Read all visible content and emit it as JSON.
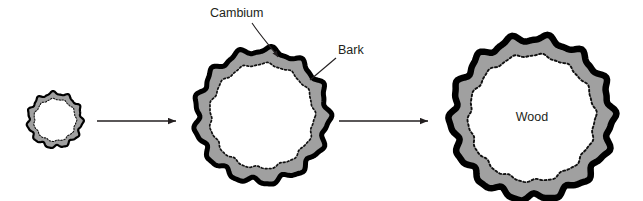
{
  "figure": {
    "background_color": "#ffffff",
    "width": 643,
    "height": 201
  },
  "labels": {
    "cambium": "Cambium",
    "bark": "Bark",
    "wood": "Wood"
  },
  "colors": {
    "bark_outline": "#000000",
    "cambium_layer_gray": "#a0a0a0",
    "wood_fill": "#ffffff",
    "cambium_dotted_line": "#111111",
    "arrow": "#231f20",
    "leader_line": "#231f20",
    "text": "#231f20"
  },
  "stages": [
    {
      "name": "stage-1-sapling",
      "order": 1,
      "center_x": 55,
      "center_y": 120,
      "outer_radius": 27,
      "inner_radius": 21,
      "bark_thickness": 2.2,
      "lobes": 11,
      "lobe_amplitude": 1.6,
      "label": ""
    },
    {
      "name": "stage-2-young-tree",
      "order": 2,
      "center_x": 262,
      "center_y": 116,
      "outer_radius": 66,
      "inner_radius": 52,
      "bark_thickness": 5.0,
      "lobes": 13,
      "lobe_amplitude": 3.2,
      "label": ""
    },
    {
      "name": "stage-3-mature-tree",
      "order": 3,
      "center_x": 532,
      "center_y": 118,
      "outer_radius": 80,
      "inner_radius": 63,
      "bark_thickness": 6.5,
      "lobes": 14,
      "lobe_amplitude": 3.6,
      "label": "Wood"
    }
  ],
  "arrows": [
    {
      "name": "arrow-stage1-to-stage2",
      "x1": 97,
      "y1": 121,
      "x2": 176,
      "y2": 121
    },
    {
      "name": "arrow-stage2-to-stage3",
      "x1": 339,
      "y1": 121,
      "x2": 428,
      "y2": 121
    }
  ],
  "leaders": [
    {
      "name": "cambium-leader",
      "label": "Cambium",
      "label_x": 210,
      "label_y": 14,
      "path": "M 252 23 C 262 38, 272 48, 278 57",
      "arrow_tip_x": 280,
      "arrow_tip_y": 61,
      "arrow_angle_deg": 60
    },
    {
      "name": "bark-leader",
      "label": "Bark",
      "label_x": 338,
      "label_y": 51,
      "path": "M 336 58 L 310 80",
      "arrow_tip_x": 310,
      "arrow_tip_y": 80,
      "arrow_angle_deg": 220
    }
  ]
}
